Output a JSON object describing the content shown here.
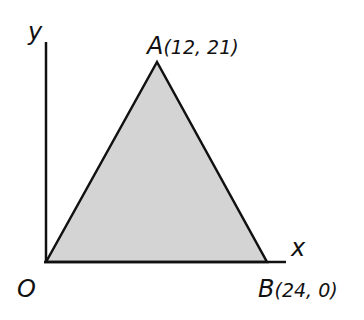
{
  "diagram": {
    "axes": {
      "x_label": "x",
      "y_label": "y"
    },
    "points": {
      "origin": {
        "label": "O",
        "x": 0,
        "y": 0
      },
      "A": {
        "label": "A",
        "coords": "(12, 21)",
        "x": 12,
        "y": 21
      },
      "B": {
        "label": "B",
        "coords": "(24, 0)",
        "x": 24,
        "y": 0
      }
    },
    "shape": "triangle OAB",
    "fill_color": "#d4d4d4",
    "stroke_color": "#111111"
  }
}
